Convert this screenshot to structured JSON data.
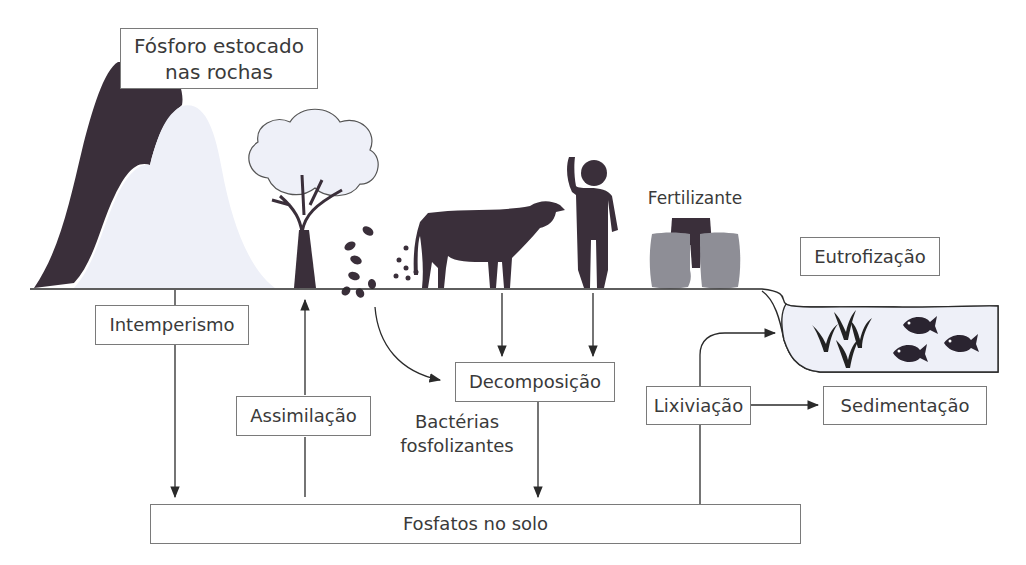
{
  "boxes": {
    "rocks": {
      "line1": "Fósforo estocado",
      "line2": "nas rochas"
    },
    "weathering": "Intemperismo",
    "assimilation": "Assimilação",
    "decomposition": "Decomposição",
    "leaching": "Lixiviação",
    "sedimentation": "Sedimentação",
    "eutrophication": "Eutrofização",
    "soil_phosphates": "Fosfatos no solo"
  },
  "labels": {
    "fertilizer": "Fertilizante",
    "bacteria_line1": "Bactérias",
    "bacteria_line2": "fosfolizantes"
  },
  "icons": [
    "mountain-rock-icon",
    "tree-icon",
    "falling-leaves-icon",
    "cow-icon",
    "person-icon",
    "fertilizer-bags-icon",
    "aquatic-plants-icon",
    "fish-icon"
  ],
  "colors": {
    "line": "#2a2a2a",
    "box_border": "#7a7a7a",
    "dark_fill": "#3a2f3a",
    "light_fill": "#eef0f8",
    "bag_fill": "#8e8e96",
    "text": "#3a3a3a"
  }
}
